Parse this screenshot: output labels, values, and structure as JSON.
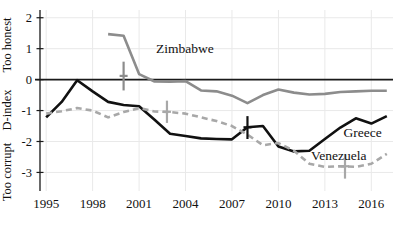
{
  "chart_data": {
    "type": "line",
    "title": "",
    "xlabel": "",
    "ylabel": "D-index",
    "ylabel_top": "Too honest",
    "ylabel_bottom": "Too corrupt",
    "xlim": [
      1994.6,
      2017.4
    ],
    "ylim": [
      -3.6,
      2.25
    ],
    "grid": true,
    "legend_position": "inline-annotations",
    "yticks": [
      2,
      1,
      0,
      -1,
      -2,
      -3
    ],
    "ytick_labels": [
      "2",
      "1",
      "0",
      "-1",
      "-2",
      "-3"
    ],
    "xticks": [
      1995,
      1998,
      2001,
      2004,
      2007,
      2010,
      2013,
      2016
    ],
    "xtick_labels": [
      "1995",
      "1998",
      "2001",
      "2004",
      "2007",
      "2010",
      "2013",
      "2016"
    ],
    "zero_reference_line": 0,
    "series": [
      {
        "name": "Greece",
        "style": "solid",
        "color": "#111111",
        "width": 2.6,
        "x": [
          1995,
          1996,
          1997,
          1998,
          1999,
          2000,
          2001,
          2002,
          2003,
          2004,
          2005,
          2006,
          2007,
          2008,
          2009,
          2010,
          2011,
          2012,
          2013,
          2014,
          2015,
          2016,
          2017
        ],
        "values": [
          -1.22,
          -0.72,
          -0.02,
          -0.38,
          -0.72,
          -0.82,
          -0.86,
          -1.3,
          -1.75,
          -1.82,
          -1.9,
          -1.92,
          -1.93,
          -1.54,
          -1.5,
          -2.16,
          -2.32,
          -2.3,
          -1.92,
          -1.55,
          -1.25,
          -1.42,
          -1.18
        ]
      },
      {
        "name": "Venezuela",
        "style": "dashed",
        "color": "#a8a8a8",
        "width": 2.6,
        "x": [
          1995,
          1996,
          1997,
          1998,
          1999,
          2000,
          2001,
          2002,
          2003,
          2004,
          2005,
          2006,
          2007,
          2008,
          2009,
          2010,
          2011,
          2012,
          2013,
          2014,
          2015,
          2016,
          2017
        ],
        "values": [
          -1.1,
          -1.02,
          -0.92,
          -1.0,
          -1.22,
          -1.05,
          -0.92,
          -1.03,
          -1.05,
          -1.1,
          -1.22,
          -1.34,
          -1.5,
          -1.78,
          -2.12,
          -2.05,
          -2.3,
          -2.72,
          -2.82,
          -2.8,
          -2.82,
          -2.72,
          -2.4
        ]
      },
      {
        "name": "Zimbabwe",
        "style": "solid",
        "color": "#8c8c8c",
        "width": 2.6,
        "x": [
          1999,
          2000,
          2001,
          2002,
          2003,
          2004,
          2005,
          2006,
          2007,
          2008,
          2009,
          2010,
          2011,
          2012,
          2013,
          2014,
          2015,
          2016,
          2017
        ],
        "values": [
          1.47,
          1.42,
          0.18,
          -0.06,
          -0.07,
          -0.05,
          -0.35,
          -0.38,
          -0.52,
          -0.76,
          -0.5,
          -0.32,
          -0.42,
          -0.48,
          -0.46,
          -0.4,
          -0.38,
          -0.36,
          -0.36
        ]
      }
    ],
    "error_bars": [
      {
        "series": "Zimbabwe",
        "x": 2000,
        "y": 0.12,
        "low": -0.35,
        "high": 0.58,
        "color": "#8c8c8c"
      },
      {
        "series": "Venezuela",
        "x": 2002.8,
        "y": -1.04,
        "low": -1.4,
        "high": -0.68,
        "color": "#a8a8a8"
      },
      {
        "series": "Greece",
        "x": 2008,
        "y": -1.54,
        "low": -1.92,
        "high": -1.18,
        "color": "#111111"
      },
      {
        "series": "Venezuela",
        "x": 2014.3,
        "y": -2.8,
        "low": -3.2,
        "high": -2.42,
        "color": "#a8a8a8"
      }
    ],
    "annotations": [
      {
        "text": "Zimbabwe",
        "x": 2002.1,
        "y": 0.86,
        "anchor": "start"
      },
      {
        "text": "Greece",
        "x": 2014.2,
        "y": -1.86,
        "anchor": "start"
      },
      {
        "text": "Venezuela",
        "x": 2012.1,
        "y": -2.6,
        "anchor": "start"
      }
    ]
  }
}
